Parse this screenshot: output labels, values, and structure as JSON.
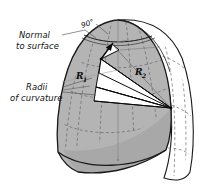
{
  "figure": {
    "background_color": "#ffffff",
    "labels": {
      "normal_line1": "Normal",
      "normal_line2": "to surface",
      "angle": "90°",
      "radii_line1": "Radii",
      "radii_line2": "of curvature",
      "r1": "R",
      "r1_sub": "1",
      "r2": "R",
      "r2_sub": "2"
    },
    "colors": {
      "shell_shaded": "#b4b4b4",
      "shell_shaded_dark": "#a0a0a0",
      "shell_outer": "#ffffff",
      "outline": "#1a1a1a",
      "grid_dashed": "#6e6e6e",
      "wedge_fill": "#ffffff",
      "leader": "#555555",
      "axis": "#8a8a8a",
      "text": "#101010"
    },
    "geometry": {
      "apex": [
        118,
        20
      ],
      "normal_tip": [
        112,
        44
      ],
      "surface_point": [
        101,
        59
      ],
      "radii_vertex": [
        171,
        108
      ],
      "axis_top": [
        118,
        21
      ],
      "axis_bottom": [
        118,
        160
      ]
    }
  }
}
